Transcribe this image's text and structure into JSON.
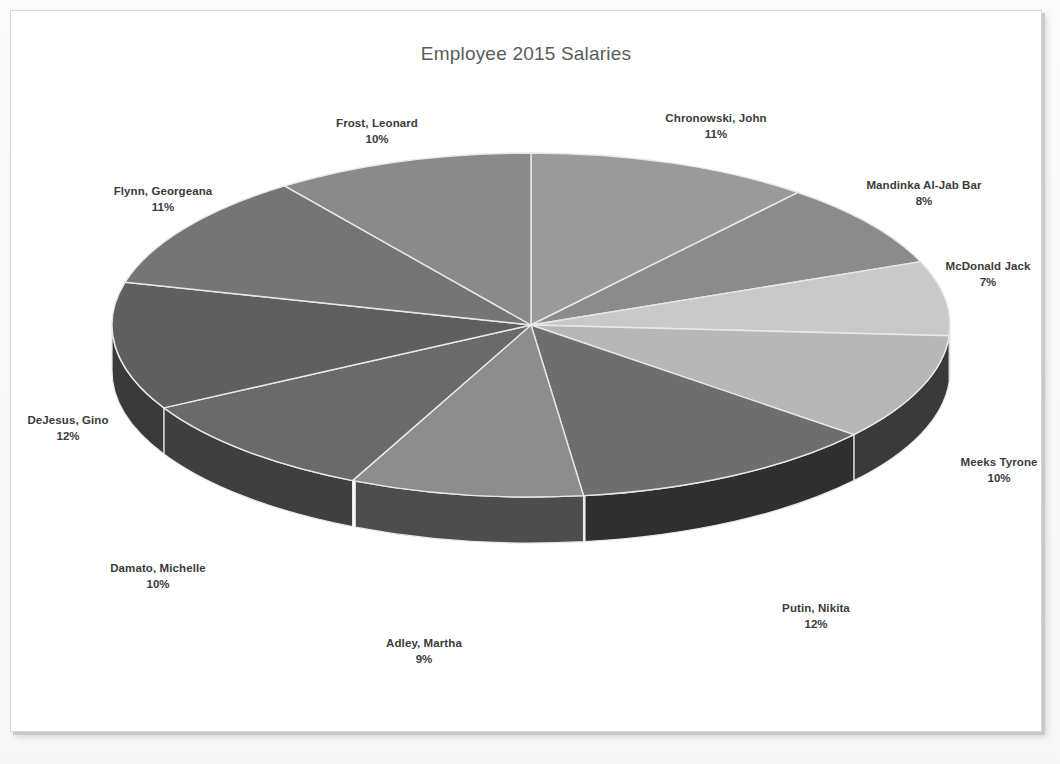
{
  "page": {
    "background_color": "#fbfbfb",
    "frame_border_color": "#d7d7d7"
  },
  "chart": {
    "title": "Employee 2015 Salaries"
  },
  "chart_data": {
    "type": "pie",
    "title": "Employee 2015 Salaries",
    "xlabel": "",
    "ylabel": "",
    "three_d": true,
    "legend_position": "none",
    "labels_outside": true,
    "label_format": "name + percent",
    "categories": [
      "Chronowski, John",
      "Mandinka  Al-Jab Bar",
      "McDonald Jack",
      "Meeks Tyrone",
      "Putin, Nikita",
      "Adley, Martha",
      "Damato, Michelle",
      "DeJesus, Gino",
      "Flynn, Georgeana",
      "Frost, Leonard"
    ],
    "values": [
      11,
      8,
      7,
      10,
      12,
      9,
      10,
      12,
      11,
      10
    ],
    "value_unit": "%",
    "slices": [
      {
        "name": "Chronowski, John",
        "percent": "11%",
        "value": 11,
        "color": "#9a9a9a",
        "side_color": "#5d5d5d",
        "label_x": 716,
        "label_y": 120
      },
      {
        "name": "Mandinka  Al-Jab Bar",
        "percent": "8%",
        "value": 8,
        "color": "#8b8b8b",
        "side_color": "#545454",
        "label_x": 924,
        "label_y": 187
      },
      {
        "name": "McDonald Jack",
        "percent": "7%",
        "value": 7,
        "color": "#c9c9c9",
        "side_color": "#7b7b7b",
        "label_x": 988,
        "label_y": 268
      },
      {
        "name": "Meeks Tyrone",
        "percent": "10%",
        "value": 10,
        "color": "#b7b7b7",
        "side_color": "#3a3a3a",
        "label_x": 999,
        "label_y": 464
      },
      {
        "name": "Putin, Nikita",
        "percent": "12%",
        "value": 12,
        "color": "#6e6e6e",
        "side_color": "#2f2f2f",
        "label_x": 816,
        "label_y": 610
      },
      {
        "name": "Adley, Martha",
        "percent": "9%",
        "value": 9,
        "color": "#8d8d8d",
        "side_color": "#4d4d4d",
        "label_x": 424,
        "label_y": 645
      },
      {
        "name": "Damato, Michelle",
        "percent": "10%",
        "value": 10,
        "color": "#6a6a6a",
        "side_color": "#3f3f3f",
        "label_x": 158,
        "label_y": 570
      },
      {
        "name": "DeJesus, Gino",
        "percent": "12%",
        "value": 12,
        "color": "#5f5f5f",
        "side_color": "#3a3a3a",
        "label_x": 68,
        "label_y": 422
      },
      {
        "name": "Flynn, Georgeana",
        "percent": "11%",
        "value": 11,
        "color": "#757575",
        "side_color": "#454545",
        "label_x": 163,
        "label_y": 193
      },
      {
        "name": "Frost, Leonard",
        "percent": "10%",
        "value": 10,
        "color": "#8a8a8a",
        "side_color": "#4f4f4f",
        "label_x": 377,
        "label_y": 125
      }
    ],
    "geometry": {
      "center_x": 531,
      "center_y": 325,
      "radius_x": 419,
      "radius_y": 172,
      "depth": 46,
      "start_angle_deg": -90,
      "direction": "clockwise",
      "slice_border_color": "#e8e8e8"
    }
  }
}
